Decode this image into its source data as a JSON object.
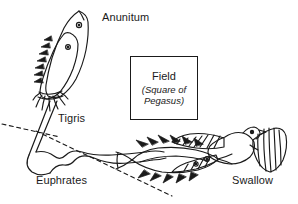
{
  "diagram": {
    "background_color": "#ffffff",
    "ink_color": "#1a1a1a"
  },
  "labels": {
    "anunitum": "Anunitum",
    "tigris": "Tigris",
    "euphrates": "Euphrates",
    "swallow": "Swallow"
  },
  "field_box": {
    "title": "Field",
    "subtitle": "(Square of Pegasus)"
  },
  "figures": {
    "upper_fish": "two-fish-figure",
    "lower_fish": "horizontal-fish-figure",
    "bird": "swallow-bird-figure"
  },
  "rivers": {
    "tigris": "tigris-channel",
    "euphrates": "euphrates-channel"
  },
  "guides": {
    "upper_dashed": "dashed-guide-line-upper",
    "lower_dashed": "dashed-guide-line-lower"
  }
}
